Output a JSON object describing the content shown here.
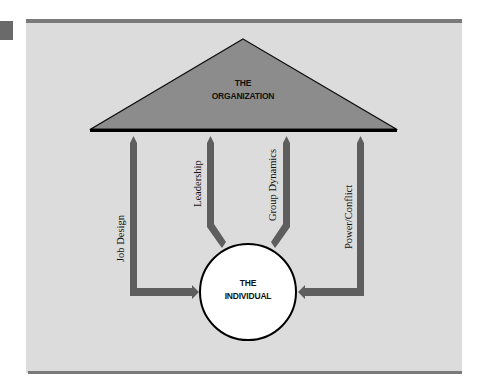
{
  "diagram": {
    "type": "organizational-behavior-model",
    "top_node": {
      "line1": "THE",
      "line2": "ORGANIZATION",
      "shape": "triangle"
    },
    "bottom_node": {
      "line1": "THE",
      "line2": "INDIVIDUAL",
      "shape": "circle"
    },
    "connectors": [
      {
        "label": "Job Design"
      },
      {
        "label": "Leadership"
      },
      {
        "label": "Group Dynamics"
      },
      {
        "label": "Power/Conflict"
      }
    ],
    "colors": {
      "background_panel": "#dcdcdc",
      "triangle_fill": "#8c8c8c",
      "arrow_fill": "#5e5e5e",
      "border_bar": "#7a7a7a",
      "circle_fill": "#ffffff",
      "outline": "#000000"
    }
  }
}
